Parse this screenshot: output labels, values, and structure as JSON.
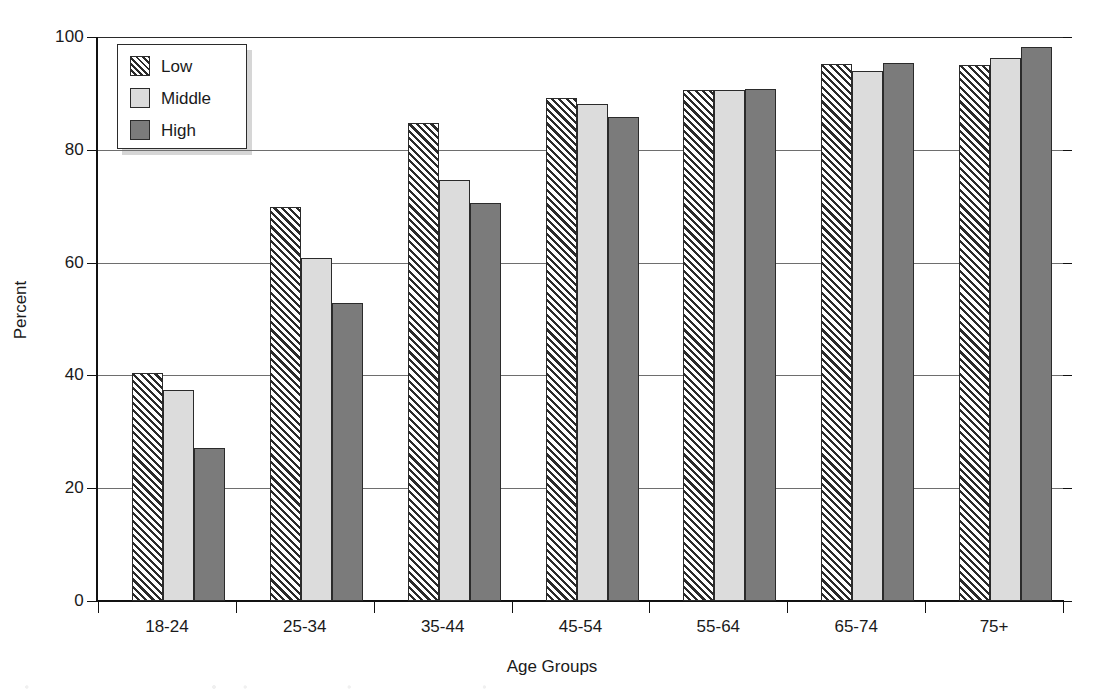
{
  "chart_data": {
    "type": "bar",
    "title": "",
    "xlabel": "Age Groups",
    "ylabel": "Percent",
    "categories": [
      "18-24",
      "25-34",
      "35-44",
      "45-54",
      "55-64",
      "65-74",
      "75+"
    ],
    "series": [
      {
        "name": "Low",
        "values": [
          40.5,
          69.8,
          84.7,
          89.2,
          90.6,
          95.3,
          95.0
        ]
      },
      {
        "name": "Middle",
        "values": [
          37.5,
          60.8,
          74.6,
          88.2,
          90.6,
          94.0,
          96.3
        ]
      },
      {
        "name": "High",
        "values": [
          27.2,
          52.8,
          70.6,
          85.9,
          90.7,
          95.4,
          98.3
        ]
      }
    ],
    "ylim": [
      0,
      100
    ],
    "yticks": [
      0,
      20,
      40,
      60,
      80,
      100
    ],
    "ytick_labels": [
      "0",
      "20",
      "40",
      "60",
      "80",
      "100"
    ],
    "grid": true,
    "legend_position": "top-left",
    "colors": {
      "low": "#ffffff",
      "middle": "#dcdcdc",
      "high": "#7b7b7b",
      "outline": "#2b2b2b",
      "grid": "#6e6e6e",
      "axis": "#111111"
    },
    "series_patterns": [
      "diagonal-hatch",
      "solid-light-gray",
      "solid-dark-gray"
    ]
  },
  "legend": {
    "items": [
      {
        "label": "Low",
        "swatch": "hatch-swatch-icon"
      },
      {
        "label": "Middle",
        "swatch": "light-gray-swatch-icon"
      },
      {
        "label": "High",
        "swatch": "dark-gray-swatch-icon"
      }
    ]
  }
}
